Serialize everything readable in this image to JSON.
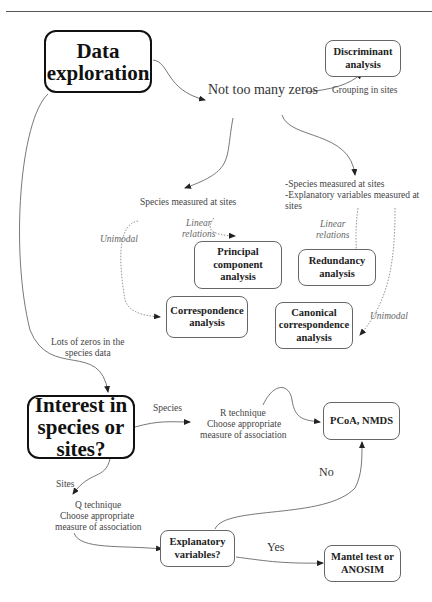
{
  "diagram": {
    "nodes": {
      "data_exploration": "Data exploration",
      "discriminant": "Discriminant analysis",
      "pca": "Principal component analysis",
      "redundancy": "Redundancy analysis",
      "correspondence": "Correspondence analysis",
      "cca": "Canonical correspondence analysis",
      "interest": "Interest in species or sites?",
      "pcoa": "PCoA, NMDS",
      "explanatory": "Explanatory variables?",
      "mantel": "Mantel test or ANOSIM"
    },
    "labels": {
      "not_too_many_zeros": "Not too many zeros",
      "grouping_in_sites": "Grouping in sites",
      "species_measured": "Species measured at sites",
      "species_expl_1": "-Species measured at sites",
      "species_expl_2": "-Explanatory variables measured at",
      "species_expl_3": "sites",
      "linear_1": "Linear",
      "relations_1": "relations",
      "linear_2": "Linear",
      "relations_2": "relations",
      "unimodal_1": "Unimodal",
      "unimodal_2": "Unimodal",
      "lots_zeros_1": "Lots of zeros in the",
      "lots_zeros_2": "species data",
      "species": "Species",
      "r_technique_1": "R technique",
      "r_technique_2": "Choose appropriate",
      "r_technique_3": "measure of association",
      "sites": "Sites",
      "q_technique_1": "Q technique",
      "q_technique_2": "Choose appropriate",
      "q_technique_3": "measure of association",
      "no": "No",
      "yes": "Yes"
    }
  }
}
